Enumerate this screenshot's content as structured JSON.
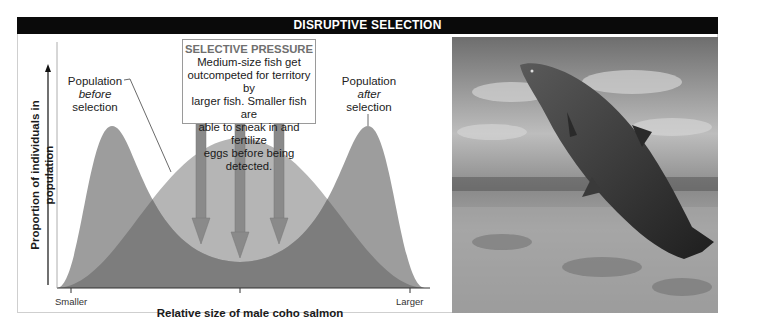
{
  "header": {
    "title": "DISRUPTIVE SELECTION"
  },
  "diagram": {
    "callout_before": {
      "line1": "Population",
      "line2": "before",
      "line3": "selection"
    },
    "callout_after": {
      "line1": "Population",
      "line2": "after",
      "line3": "selection"
    },
    "selective_pressure": {
      "title": "SELECTIVE PRESSURE",
      "lines": [
        "Medium-size fish get",
        "outcompeted for territory by",
        "larger fish. Smaller fish are",
        "able to sneak in and fertilize",
        "eggs before being detected."
      ]
    },
    "y_axis_label": "Proportion of individuals in population",
    "x_axis_label": "Relative size of male coho salmon",
    "x_tick_left": "Smaller",
    "x_tick_right": "Larger",
    "colors": {
      "before_population": "#b3b3b3",
      "after_population": "#9b9b9b",
      "overlap": "#7a7a7a",
      "arrow": "#888888",
      "header_bg": "#0a0a0a"
    },
    "arrow_count": 3
  },
  "photo": {
    "subject": "Male coho salmon leaping out of river water"
  }
}
